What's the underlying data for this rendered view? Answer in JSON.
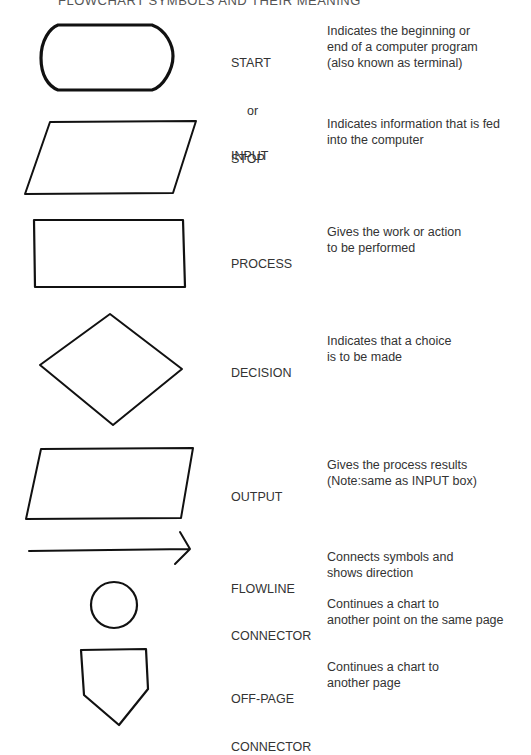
{
  "header": {
    "title": "FLOWCHART SYMBOLS AND THEIR MEANING"
  },
  "symbols": [
    {
      "shape": "terminal-icon",
      "name_lines": [
        "START",
        "or",
        "STOP"
      ],
      "desc_lines": [
        "Indicates the beginning or",
        "end of a computer program",
        "(also known as terminal)"
      ]
    },
    {
      "shape": "parallelogram-icon",
      "name_lines": [
        "INPUT"
      ],
      "desc_lines": [
        "Indicates information that is fed",
        "into the computer"
      ]
    },
    {
      "shape": "rectangle-icon",
      "name_lines": [
        "PROCESS"
      ],
      "desc_lines": [
        "Gives the work or action",
        "to be performed"
      ]
    },
    {
      "shape": "diamond-icon",
      "name_lines": [
        "DECISION"
      ],
      "desc_lines": [
        "Indicates that a choice",
        "is to be made"
      ]
    },
    {
      "shape": "parallelogram-icon",
      "name_lines": [
        "OUTPUT"
      ],
      "desc_lines": [
        "Gives the process results",
        "(Note:same as INPUT box)"
      ]
    },
    {
      "shape": "arrow-icon",
      "name_lines": [
        "FLOWLINE"
      ],
      "desc_lines": [
        "Connects symbols and",
        "shows direction"
      ]
    },
    {
      "shape": "circle-icon",
      "name_lines": [
        "CONNECTOR"
      ],
      "desc_lines": [
        "Continues a chart to",
        "another point on the same page"
      ]
    },
    {
      "shape": "pentagon-icon",
      "name_lines": [
        "OFF-PAGE",
        "CONNECTOR"
      ],
      "desc_lines": [
        "Continues a chart to",
        "another page"
      ]
    }
  ],
  "colors": {
    "ink": "#111111",
    "text": "#333333",
    "background": "#ffffff"
  }
}
